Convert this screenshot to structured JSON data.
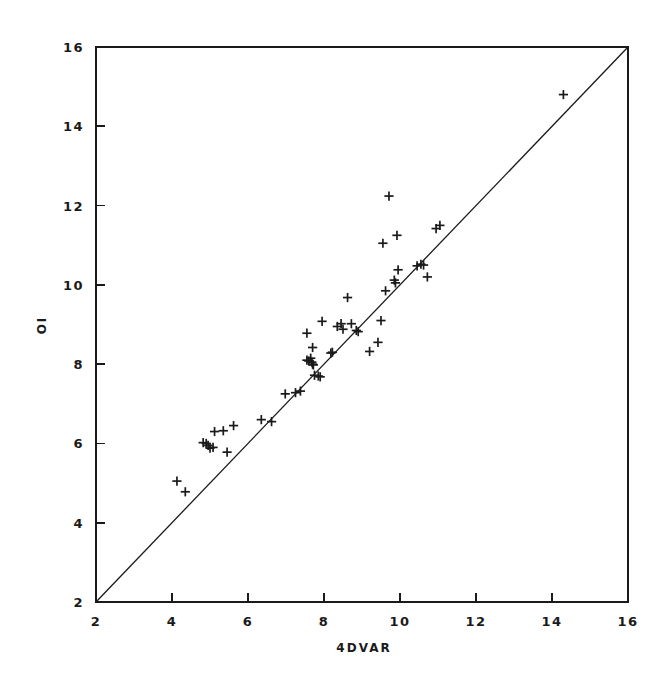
{
  "figure": {
    "background_color": "#ffffff",
    "ink_color": "#1a1a1a",
    "width": 668,
    "height": 673
  },
  "chart_data": {
    "type": "scatter",
    "title": "",
    "subtitle": "",
    "xlabel": "4DVAR",
    "ylabel": "OI",
    "xlim": [
      2,
      16
    ],
    "ylim": [
      2,
      16
    ],
    "xticks": [
      2,
      4,
      6,
      8,
      10,
      12,
      14,
      16
    ],
    "yticks": [
      2,
      4,
      6,
      8,
      10,
      12,
      14,
      16
    ],
    "xtick_labels": [
      "2",
      "4",
      "6",
      "8",
      "10",
      "12",
      "14",
      "16"
    ],
    "ytick_labels": [
      "2",
      "4",
      "6",
      "8",
      "10",
      "12",
      "14",
      "16"
    ],
    "grid": false,
    "legend": false,
    "legend_position": "none",
    "marker_symbol": "plus",
    "marker_color": "#1a1a1a",
    "annotations": [
      {
        "kind": "reference-line",
        "label": "one-to-one line",
        "from": [
          2,
          2
        ],
        "to": [
          16,
          16
        ],
        "style": "solid",
        "color": "#1a1a1a"
      }
    ],
    "series": [
      {
        "name": "OI vs 4DVAR",
        "points": [
          [
            4.13,
            5.05
          ],
          [
            4.35,
            4.78
          ],
          [
            4.82,
            6.02
          ],
          [
            4.9,
            6.0
          ],
          [
            4.95,
            5.95
          ],
          [
            5.0,
            5.88
          ],
          [
            5.08,
            5.9
          ],
          [
            5.12,
            6.3
          ],
          [
            5.35,
            6.32
          ],
          [
            5.45,
            5.78
          ],
          [
            5.62,
            6.45
          ],
          [
            6.35,
            6.6
          ],
          [
            6.62,
            6.55
          ],
          [
            6.98,
            7.25
          ],
          [
            7.25,
            7.28
          ],
          [
            7.38,
            7.32
          ],
          [
            7.55,
            8.1
          ],
          [
            7.6,
            8.08
          ],
          [
            7.65,
            8.15
          ],
          [
            7.68,
            8.05
          ],
          [
            7.7,
            8.0
          ],
          [
            7.72,
            7.98
          ],
          [
            7.75,
            7.72
          ],
          [
            7.85,
            7.7
          ],
          [
            7.9,
            7.68
          ],
          [
            7.55,
            8.78
          ],
          [
            7.7,
            8.42
          ],
          [
            7.95,
            9.08
          ],
          [
            8.18,
            8.28
          ],
          [
            8.22,
            8.3
          ],
          [
            8.35,
            8.95
          ],
          [
            8.45,
            9.02
          ],
          [
            8.5,
            8.88
          ],
          [
            8.72,
            9.02
          ],
          [
            8.85,
            8.85
          ],
          [
            8.9,
            8.82
          ],
          [
            8.62,
            9.68
          ],
          [
            9.2,
            8.32
          ],
          [
            9.42,
            8.55
          ],
          [
            9.5,
            9.1
          ],
          [
            9.55,
            11.05
          ],
          [
            9.62,
            9.85
          ],
          [
            9.71,
            12.24
          ],
          [
            9.85,
            10.12
          ],
          [
            9.88,
            10.05
          ],
          [
            9.92,
            11.25
          ],
          [
            9.95,
            10.38
          ],
          [
            10.45,
            10.48
          ],
          [
            10.55,
            10.52
          ],
          [
            10.62,
            10.5
          ],
          [
            10.72,
            10.2
          ],
          [
            10.95,
            11.42
          ],
          [
            11.05,
            11.5
          ],
          [
            14.3,
            14.8
          ]
        ]
      }
    ]
  }
}
